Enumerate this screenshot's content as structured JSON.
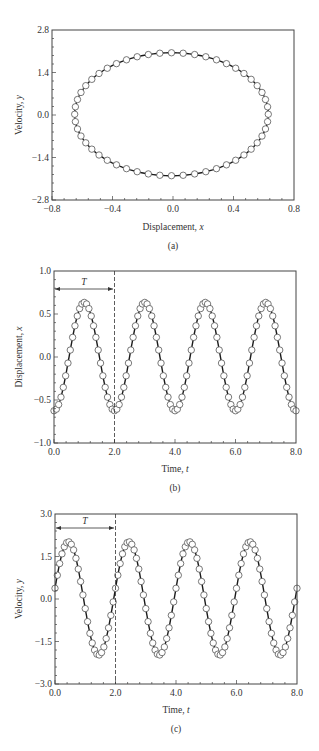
{
  "chart_data": [
    {
      "id": "a",
      "type": "scatter",
      "caption": "(a)",
      "title": "",
      "xlabel": "Displacement, ",
      "xlabel_var": "x",
      "ylabel": "Velocity, ",
      "ylabel_var": "y",
      "xlim": [
        -0.8,
        0.8
      ],
      "ylim": [
        -2.8,
        2.8
      ],
      "xticks": [
        -0.8,
        -0.4,
        0.0,
        0.4,
        0.8
      ],
      "xtick_labels": [
        "−0.8",
        "−0.4",
        "0.0",
        "0.4",
        "0.8"
      ],
      "yticks": [
        -2.8,
        -1.4,
        0.0,
        1.4,
        2.8
      ],
      "ytick_labels": [
        "−2.8",
        "−1.4",
        "0.0",
        "1.4",
        "2.8"
      ],
      "grid": false,
      "legend": null,
      "description": "Phase-plane trajectory: closed ellipse of open circles on a solid line",
      "series": [
        {
          "name": "numerical (circles)",
          "style": "open-circle",
          "model": {
            "x": "-0.64*cos(pi*t)",
            "y": "2.0*sin(pi*t)",
            "points": 52
          }
        },
        {
          "name": "exact (line)",
          "style": "solid-line"
        }
      ],
      "extents": {
        "x_min": -0.65,
        "x_max": 0.63,
        "y_min": -2.0,
        "y_max": 2.05
      }
    },
    {
      "id": "b",
      "type": "line",
      "caption": "(b)",
      "xlabel": "Time, ",
      "xlabel_var": "t",
      "ylabel": "Displacement, ",
      "ylabel_var": "x",
      "xlim": [
        0.0,
        8.0
      ],
      "ylim": [
        -1.0,
        1.0
      ],
      "xticks": [
        0.0,
        2.0,
        4.0,
        6.0,
        8.0
      ],
      "xtick_labels": [
        "0.0",
        "2.0",
        "4.0",
        "6.0",
        "8.0"
      ],
      "yticks": [
        -1.0,
        -0.5,
        0.0,
        0.5,
        1.0
      ],
      "ytick_labels": [
        "−1.0",
        "−0.5",
        "0.0",
        "0.5",
        "1.0"
      ],
      "grid": false,
      "legend": null,
      "annotations": [
        {
          "text": "T",
          "type": "period-arrow",
          "from": 0.0,
          "to": 2.0,
          "y": 0.8
        },
        {
          "type": "dashed-vline",
          "x": 2.0
        }
      ],
      "series": [
        {
          "name": "x(t)",
          "style": "open-circle+line",
          "model": "-0.63*cos(pi*t)",
          "points_per_period": 26
        }
      ],
      "key_values": {
        "min": -0.63,
        "max": 0.64,
        "peaks_t": [
          1.0,
          3.0,
          5.0,
          7.0
        ],
        "troughs_t": [
          0.0,
          2.0,
          4.0,
          6.0,
          8.0
        ]
      }
    },
    {
      "id": "c",
      "type": "line",
      "caption": "(c)",
      "xlabel": "Time, ",
      "xlabel_var": "t",
      "ylabel": "Velocity, ",
      "ylabel_var": "y",
      "xlim": [
        0.0,
        8.0
      ],
      "ylim": [
        -3.0,
        3.0
      ],
      "xticks": [
        0.0,
        2.0,
        4.0,
        6.0,
        8.0
      ],
      "xtick_labels": [
        "0.0",
        "2.0",
        "4.0",
        "6.0",
        "8.0"
      ],
      "yticks": [
        -3.0,
        -1.5,
        0.0,
        1.5,
        3.0
      ],
      "ytick_labels": [
        "−3.0",
        "−1.5",
        "0.0",
        "1.5",
        "3.0"
      ],
      "grid": false,
      "legend": null,
      "annotations": [
        {
          "text": "T",
          "type": "period-arrow",
          "from": 0.0,
          "to": 2.0,
          "y": 2.5
        },
        {
          "type": "dashed-vline",
          "x": 2.0
        }
      ],
      "series": [
        {
          "name": "y(t)",
          "style": "open-circle+line",
          "model": "2.0*sin(pi*t)",
          "points_per_period": 26
        }
      ],
      "key_values": {
        "min": -2.0,
        "max": 2.05,
        "peaks_t": [
          0.55,
          2.55,
          4.55,
          6.55
        ],
        "troughs_t": [
          1.6,
          3.6,
          5.6,
          7.6
        ]
      }
    }
  ],
  "panels": {
    "a": {
      "caption": "(a)",
      "xlabel": "Displacement, ",
      "xvar": "x",
      "ylabel": "Velocity, ",
      "yvar": "y"
    },
    "b": {
      "caption": "(b)",
      "xlabel": "Time, ",
      "xvar": "t",
      "ylabel": "Displacement, ",
      "yvar": "x",
      "period_label": "T"
    },
    "c": {
      "caption": "(c)",
      "xlabel": "Time, ",
      "xvar": "t",
      "ylabel": "Velocity, ",
      "yvar": "y",
      "period_label": "T"
    }
  },
  "ticks": {
    "a_x": [
      "−0.8",
      "−0.4",
      "0.0",
      "0.4",
      "0.8"
    ],
    "a_y": [
      "2.8",
      "1.4",
      "0.0",
      "−1.4",
      "−2.8"
    ],
    "b_x": [
      "0.0",
      "2.0",
      "4.0",
      "6.0",
      "8.0"
    ],
    "b_y": [
      "1.0",
      "0.5",
      "0.0",
      "−0.5",
      "−1.0"
    ],
    "c_x": [
      "0.0",
      "2.0",
      "4.0",
      "6.0",
      "8.0"
    ],
    "c_y": [
      "3.0",
      "1.5",
      "0.0",
      "−1.5",
      "−3.0"
    ]
  },
  "colors": {
    "line": "#1a1a1a",
    "marker_fill": "#ffffff",
    "marker_stroke": "#555555",
    "frame": "#444444"
  }
}
